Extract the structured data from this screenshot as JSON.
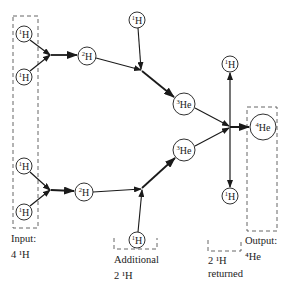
{
  "diagram": {
    "colors": {
      "line": "#1a1a1a",
      "dash": "#555555",
      "background": "#ffffff"
    },
    "nodes": [
      {
        "id": "h1a",
        "mass": "1",
        "symbol": "H",
        "x": 24,
        "y": 34,
        "r": 8
      },
      {
        "id": "h1b",
        "mass": "1",
        "symbol": "H",
        "x": 24,
        "y": 77,
        "r": 8
      },
      {
        "id": "h1c",
        "mass": "1",
        "symbol": "H",
        "x": 24,
        "y": 166,
        "r": 8
      },
      {
        "id": "h1d",
        "mass": "1",
        "symbol": "H",
        "x": 24,
        "y": 212,
        "r": 8
      },
      {
        "id": "h2a",
        "mass": "2",
        "symbol": "H",
        "x": 87,
        "y": 56,
        "r": 9
      },
      {
        "id": "h2b",
        "mass": "2",
        "symbol": "H",
        "x": 84,
        "y": 192,
        "r": 9
      },
      {
        "id": "h1top",
        "mass": "1",
        "symbol": "H",
        "x": 137,
        "y": 20,
        "r": 8
      },
      {
        "id": "h1add",
        "mass": "1",
        "symbol": "H",
        "x": 137,
        "y": 240,
        "r": 8
      },
      {
        "id": "he3a",
        "mass": "3",
        "symbol": "He",
        "x": 184,
        "y": 104,
        "r": 11
      },
      {
        "id": "he3b",
        "mass": "3",
        "symbol": "He",
        "x": 184,
        "y": 150,
        "r": 11
      },
      {
        "id": "h1ret_up",
        "mass": "1",
        "symbol": "H",
        "x": 230,
        "y": 64,
        "r": 8
      },
      {
        "id": "h1ret_dn",
        "mass": "1",
        "symbol": "H",
        "x": 230,
        "y": 196,
        "r": 8
      },
      {
        "id": "he4",
        "mass": "4",
        "symbol": "He",
        "x": 263,
        "y": 127,
        "r": 13
      }
    ],
    "captions": {
      "input_line1": "Input:",
      "input_line2": "4 ¹H",
      "additional_line1": "Additional",
      "additional_line2": "2 ¹H",
      "returned_line1": "2 ¹H",
      "returned_line2": "returned",
      "output_line1": "Output:",
      "output_line2": "⁴He"
    }
  }
}
